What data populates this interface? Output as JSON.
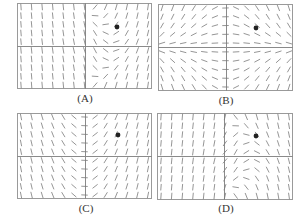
{
  "figure": {
    "colors": {
      "frame": "#9a9a9a",
      "axis": "#8a8a8a",
      "segment": "#7a7a7a",
      "dot": "#222222",
      "label": "#333333"
    },
    "grid": {
      "cols": 13,
      "rows": 10,
      "xrange": [
        -3.25,
        3.25
      ],
      "yrange": [
        -2.5,
        2.5
      ],
      "segment_length": 6.5
    },
    "panels": [
      {
        "id": "A",
        "label": "(A)",
        "left": 17,
        "top": 3,
        "width": 135,
        "height": 86,
        "axis_x": 68,
        "axis_y": 43,
        "dot": [
          100,
          24
        ],
        "field": "A",
        "label_pos": [
          65,
          92
        ]
      },
      {
        "id": "B",
        "label": "(B)",
        "left": 158,
        "top": 4,
        "width": 135,
        "height": 87,
        "axis_x": 68,
        "axis_y": 43,
        "dot": [
          98,
          24
        ],
        "field": "B",
        "label_pos": [
          206,
          94
        ]
      },
      {
        "id": "C",
        "label": "(C)",
        "left": 17,
        "top": 113,
        "width": 135,
        "height": 86,
        "axis_x": 68,
        "axis_y": 43,
        "dot": [
          101,
          22
        ],
        "field": "C",
        "label_pos": [
          66,
          202
        ]
      },
      {
        "id": "D",
        "label": "(D)",
        "left": 157,
        "top": 113,
        "width": 136,
        "height": 87,
        "axis_x": 67,
        "axis_y": 43,
        "dot": [
          99,
          23
        ],
        "field": "D",
        "label_pos": [
          206,
          202
        ]
      }
    ]
  }
}
